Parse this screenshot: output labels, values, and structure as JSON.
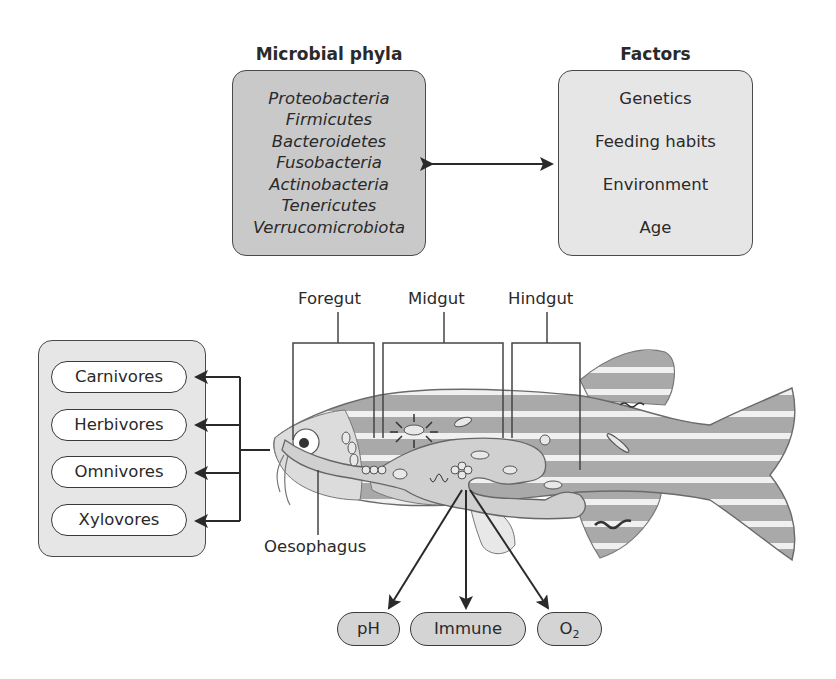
{
  "microbial_phyla": {
    "title": "Microbial phyla",
    "items": [
      "Proteobacteria",
      "Firmicutes",
      "Bacteroidetes",
      "Fusobacteria",
      "Actinobacteria",
      "Tenericutes",
      "Verrucomicrobiota"
    ]
  },
  "factors": {
    "title": "Factors",
    "items": [
      "Genetics",
      "Feeding habits",
      "Environment",
      "Age"
    ]
  },
  "feeding_types": {
    "items": [
      "Carnivores",
      "Herbivores",
      "Omnivores",
      "Xylovores"
    ]
  },
  "gut_regions": {
    "foregut": "Foregut",
    "midgut": "Midgut",
    "hindgut": "Hindgut",
    "oesophagus": "Oesophagus"
  },
  "outcomes": {
    "ph": "pH",
    "immune": "Immune",
    "o2_base": "O",
    "o2_sub": "2"
  },
  "colors": {
    "phyla_box": "#c9c9c9",
    "factors_box": "#e6e6e6",
    "fish_body": "#a9a9a9",
    "gut": "#d0d0d0",
    "stroke": "#3a3a3a"
  }
}
